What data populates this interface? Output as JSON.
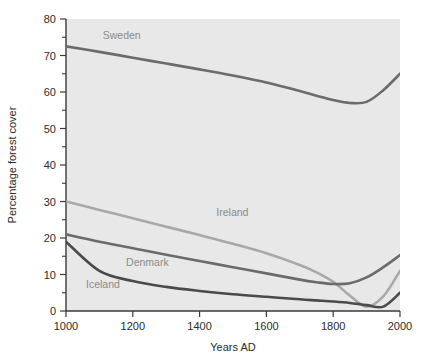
{
  "chart_data": {
    "type": "line",
    "title": "",
    "subtitle": "",
    "xlabel": "Years AD",
    "ylabel": "Percentage forest cover",
    "xlim": [
      1000,
      2000
    ],
    "ylim": [
      0,
      80
    ],
    "xticks": [
      1000,
      1200,
      1400,
      1600,
      1800,
      2000
    ],
    "yticks": [
      0,
      10,
      20,
      30,
      40,
      50,
      60,
      70,
      80
    ],
    "yminorticks": [
      5,
      15,
      25,
      35,
      45,
      55,
      65,
      75
    ],
    "grid": false,
    "legend": "inline-labels",
    "plot_background": "#e8e8e8",
    "page_background": "#ffffff",
    "x": [
      1000,
      1100,
      1200,
      1300,
      1400,
      1500,
      1600,
      1700,
      1750,
      1800,
      1850,
      1900,
      1950,
      2000
    ],
    "series": [
      {
        "name": "Sweden",
        "color": "#6b6b6b",
        "label_x": 1110,
        "label_y": 74.5,
        "values": [
          72.5,
          71.0,
          69.4,
          67.8,
          66.2,
          64.5,
          62.6,
          60.3,
          59.0,
          57.8,
          57.0,
          57.3,
          60.5,
          65.0
        ]
      },
      {
        "name": "Ireland",
        "color": "#a8a8a8",
        "label_x": 1450,
        "label_y": 26.0,
        "values": [
          30.0,
          27.7,
          25.4,
          23.1,
          20.8,
          18.4,
          15.8,
          12.6,
          10.6,
          8.0,
          4.2,
          1.2,
          4.0,
          11.0
        ]
      },
      {
        "name": "Denmark",
        "color": "#6b6b6b",
        "label_x": 1180,
        "label_y": 12.2,
        "values": [
          21.0,
          19.0,
          17.2,
          15.4,
          13.7,
          12.0,
          10.3,
          8.6,
          7.9,
          7.4,
          7.6,
          9.2,
          12.0,
          15.3
        ]
      },
      {
        "name": "Iceland",
        "color": "#4a4a4a",
        "label_x": 1060,
        "label_y": 6.2,
        "values": [
          19.0,
          11.0,
          8.2,
          6.6,
          5.5,
          4.6,
          3.9,
          3.2,
          2.9,
          2.6,
          2.2,
          1.6,
          1.2,
          5.0
        ]
      }
    ]
  }
}
